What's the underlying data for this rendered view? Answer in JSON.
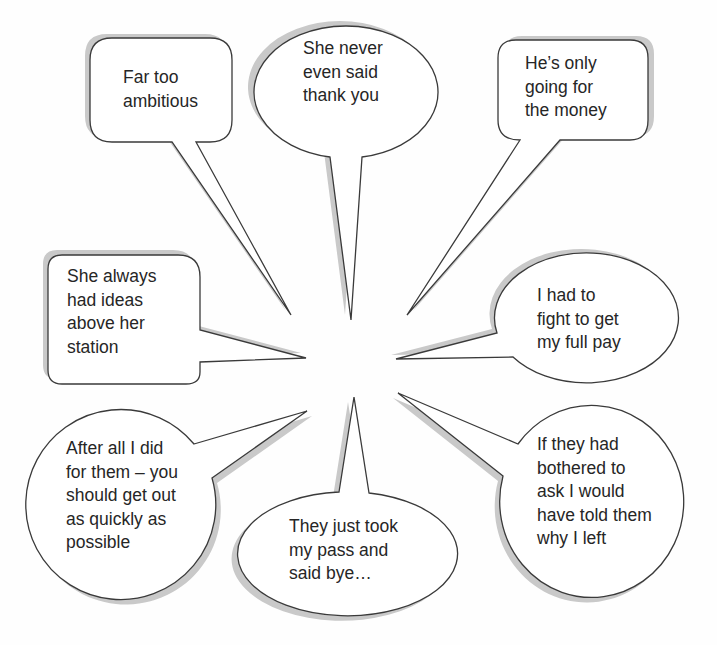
{
  "diagram": {
    "type": "speech-bubble-cluster",
    "center_hint": "all bubble tails point toward a shared empty center",
    "bubbles": [
      {
        "id": "far-too-ambitious",
        "shape": "rounded-rectangle",
        "text": "Far too\nambitious"
      },
      {
        "id": "never-said-thank-you",
        "shape": "ellipse",
        "text": "She never\neven said\nthank you"
      },
      {
        "id": "only-going-for-money",
        "shape": "rounded-rectangle",
        "text": "He’s only\ngoing for\nthe money"
      },
      {
        "id": "ideas-above-station",
        "shape": "rounded-rectangle",
        "text": "She always\nhad ideas\nabove her\nstation"
      },
      {
        "id": "fight-for-full-pay",
        "shape": "ellipse",
        "text": "I had to\nfight to get\nmy full pay"
      },
      {
        "id": "after-all-i-did",
        "shape": "circle",
        "text": "After all I did\nfor them – you\nshould get out\nas quickly as\npossible"
      },
      {
        "id": "took-my-pass",
        "shape": "ellipse",
        "text": "They just took\nmy pass and\nsaid bye…"
      },
      {
        "id": "bothered-to-ask",
        "shape": "circle",
        "text": "If they had\nbothered to\nask I would\nhave told them\nwhy I left"
      }
    ]
  },
  "colors": {
    "outline": "#3a3a3a",
    "shadow": "#c9c9c9",
    "fill": "#ffffff",
    "text": "#262626"
  }
}
